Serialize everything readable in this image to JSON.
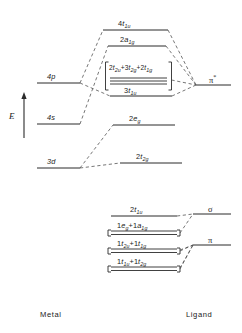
{
  "diagram": {
    "axis": {
      "label": "E",
      "direction": "up"
    },
    "captions": {
      "left": "Metal",
      "right": "Ligand"
    }
  },
  "metal_levels": [
    {
      "id": "4p",
      "label": "4p",
      "base": "4",
      "orb": "p"
    },
    {
      "id": "4s",
      "label": "4s",
      "base": "4",
      "orb": "s"
    },
    {
      "id": "3d",
      "label": "3d",
      "base": "3",
      "orb": "d"
    }
  ],
  "mo_levels": [
    {
      "id": "4t1u",
      "label": "4t1u",
      "base": "4",
      "sym": "t",
      "sub": "1u"
    },
    {
      "id": "2a1g",
      "label": "2a1g",
      "base": "2",
      "sym": "a",
      "sub": "1g"
    },
    {
      "id": "3t1u",
      "label": "3t1u",
      "base": "3",
      "sym": "t",
      "sub": "1u"
    },
    {
      "id": "2eg",
      "label": "2eg",
      "base": "2",
      "sym": "e",
      "sub": "g"
    },
    {
      "id": "2t2g",
      "label": "2t2g",
      "base": "2",
      "sym": "t",
      "sub": "2g"
    }
  ],
  "nonbonding_cluster": {
    "id": "nb-cluster",
    "label": "2t2u+3t2g+2t1g",
    "parts": [
      {
        "base": "2",
        "sym": "t",
        "sub": "2u"
      },
      {
        "base": "3",
        "sym": "t",
        "sub": "2g"
      },
      {
        "base": "2",
        "sym": "t",
        "sub": "1g"
      }
    ],
    "line_count": 3
  },
  "ligand_levels": [
    {
      "id": "2t1u",
      "label": "2t1u",
      "parts": [
        {
          "base": "2",
          "sym": "t",
          "sub": "1u"
        }
      ]
    },
    {
      "id": "1eg-1a1g",
      "label": "1eg+1a1g",
      "parts": [
        {
          "base": "1",
          "sym": "e",
          "sub": "g"
        },
        {
          "base": "1",
          "sym": "a",
          "sub": "1g"
        }
      ]
    },
    {
      "id": "1t2u-1t1g",
      "label": "1t2u+1t1g",
      "parts": [
        {
          "base": "1",
          "sym": "t",
          "sub": "2u"
        },
        {
          "base": "1",
          "sym": "t",
          "sub": "1g"
        }
      ]
    },
    {
      "id": "1t1u-1t2g",
      "label": "1t1u+1t2g",
      "parts": [
        {
          "base": "1",
          "sym": "t",
          "sub": "1u"
        },
        {
          "base": "1",
          "sym": "t",
          "sub": "2g"
        }
      ]
    }
  ],
  "ligand_groups": [
    {
      "id": "pi-star",
      "label": "π*",
      "symbol": "π",
      "star": "*"
    },
    {
      "id": "sigma",
      "label": "σ",
      "symbol": "σ",
      "star": ""
    },
    {
      "id": "pi",
      "label": "π",
      "symbol": "π",
      "star": ""
    }
  ],
  "colors": {
    "line": "#2b2b2b",
    "dashed": "#4a4a4a",
    "text": "#1a1a1a",
    "background": "#ffffff"
  }
}
